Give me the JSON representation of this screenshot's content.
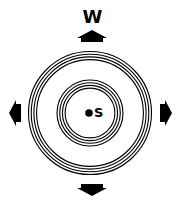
{
  "diagram": {
    "title_label": "W",
    "center_label": "S",
    "colors": {
      "ink": "#000000",
      "background": "#ffffff"
    },
    "center": {
      "x": 90,
      "y": 113
    },
    "outer_rings": {
      "count": 4,
      "radii": [
        61.5,
        59,
        56.5,
        54
      ]
    },
    "inner_rings": {
      "count": 4,
      "radii": [
        33,
        30.5,
        28,
        25.5
      ]
    },
    "center_dot": {
      "x": 89,
      "y": 113,
      "r": 3.8
    },
    "arrows": [
      {
        "name": "up-arrow",
        "direction": "up"
      },
      {
        "name": "down-arrow",
        "direction": "down"
      },
      {
        "name": "left-arrow",
        "direction": "left"
      },
      {
        "name": "right-arrow",
        "direction": "right"
      }
    ]
  }
}
